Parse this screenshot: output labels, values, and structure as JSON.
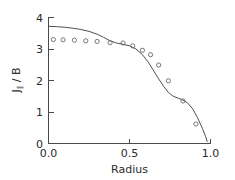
{
  "chart_data": {
    "type": "scatter",
    "title": "",
    "subtitle": "",
    "xlabel": "Radius",
    "ylabel": "J∥ / B",
    "ylabel_base": "J",
    "ylabel_subscript": "∥",
    "ylabel_rest": " / B",
    "xlim": [
      0.0,
      1.0
    ],
    "ylim": [
      0.0,
      4.0
    ],
    "xticks": [
      0.0,
      0.5,
      1.0
    ],
    "xticklabels": [
      "0.0",
      "0.5",
      "1.0"
    ],
    "yticks": [
      0,
      1,
      2,
      3,
      4
    ],
    "yticklabels": [
      "0",
      "1",
      "2",
      "3",
      "4"
    ],
    "grid": false,
    "legend": false,
    "legend_position": "none",
    "axis_style": "left-and-bottom-spines",
    "series": [
      {
        "name": "model curve",
        "type": "line",
        "marker": "none",
        "color": "#4f4f4f",
        "x": [
          0.0,
          0.05,
          0.1,
          0.15,
          0.2,
          0.25,
          0.3,
          0.34,
          0.38,
          0.42,
          0.46,
          0.5,
          0.54,
          0.58,
          0.62,
          0.65,
          0.68,
          0.71,
          0.74,
          0.77,
          0.8,
          0.83,
          0.86,
          0.89,
          0.92,
          0.95,
          0.97,
          0.98
        ],
        "y": [
          3.72,
          3.71,
          3.69,
          3.66,
          3.62,
          3.56,
          3.47,
          3.37,
          3.26,
          3.19,
          3.15,
          3.1,
          3.0,
          2.82,
          2.55,
          2.3,
          2.05,
          1.82,
          1.62,
          1.5,
          1.44,
          1.38,
          1.28,
          1.1,
          0.82,
          0.48,
          0.22,
          0.05
        ]
      },
      {
        "name": "data points",
        "type": "scatter",
        "marker": "open-circle",
        "color": "#6a6a6a",
        "x": [
          0.03,
          0.09,
          0.16,
          0.23,
          0.3,
          0.38,
          0.46,
          0.52,
          0.58,
          0.63,
          0.68,
          0.74,
          0.83,
          0.91
        ],
        "y": [
          3.3,
          3.29,
          3.28,
          3.26,
          3.24,
          3.2,
          3.19,
          3.1,
          2.96,
          2.82,
          2.49,
          1.99,
          1.35,
          0.62
        ]
      }
    ]
  },
  "axes": {
    "x_axis_name": "radius-axis",
    "y_axis_name": "j-over-b-axis"
  }
}
